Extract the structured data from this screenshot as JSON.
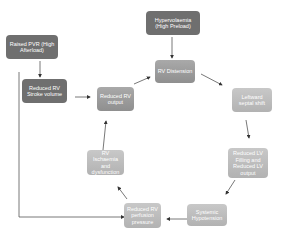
{
  "diagram": {
    "type": "cycle-flowchart",
    "nodes": [
      {
        "id": "raised_pvr",
        "label": "Raised PVR (High Afterload)"
      },
      {
        "id": "reduced_rv_sv",
        "label": "Reduced RV Stroke volume"
      },
      {
        "id": "hypervolaemia",
        "label": "Hypervolaemia (High Preload)"
      },
      {
        "id": "rv_distension",
        "label": "RV Distension"
      },
      {
        "id": "leftward_shift",
        "label": "Leftward septal shift"
      },
      {
        "id": "reduced_lv",
        "label": "Reduced LV Filling and Reduced LV output"
      },
      {
        "id": "systemic_hypo",
        "label": "Systemic Hypotension"
      },
      {
        "id": "reduced_rv_perf",
        "label": "Reduced RV perfusion pressure"
      },
      {
        "id": "rv_ischaemia",
        "label": "RV Ischaemia and dysfunction"
      },
      {
        "id": "reduced_rv_out",
        "label": "Reduced RV output"
      }
    ],
    "edges": [
      [
        "raised_pvr",
        "reduced_rv_sv"
      ],
      [
        "raised_pvr",
        "reduced_rv_perf"
      ],
      [
        "reduced_rv_sv",
        "reduced_rv_out"
      ],
      [
        "hypervolaemia",
        "rv_distension"
      ],
      [
        "reduced_rv_out",
        "rv_distension"
      ],
      [
        "rv_distension",
        "leftward_shift"
      ],
      [
        "leftward_shift",
        "reduced_lv"
      ],
      [
        "reduced_lv",
        "systemic_hypo"
      ],
      [
        "systemic_hypo",
        "reduced_rv_perf"
      ],
      [
        "reduced_rv_perf",
        "rv_ischaemia"
      ],
      [
        "rv_ischaemia",
        "reduced_rv_out"
      ]
    ]
  },
  "labels": {
    "raised_pvr": "Raised PVR (High Afterload)",
    "reduced_rv_sv": "Reduced RV Stroke volume",
    "hypervolaemia": "Hypervolaemia (High Preload)",
    "rv_distension": "RV Distension",
    "leftward_shift": "Leftward septal shift",
    "reduced_lv": "Reduced LV Filling and Reduced LV output",
    "systemic_hypo": "Systemic Hypotension",
    "reduced_rv_perf": "Reduced RV perfusion pressure",
    "rv_ischaemia": "RV Ischaemia and dysfunction",
    "reduced_rv_out": "Reduced RV output"
  }
}
